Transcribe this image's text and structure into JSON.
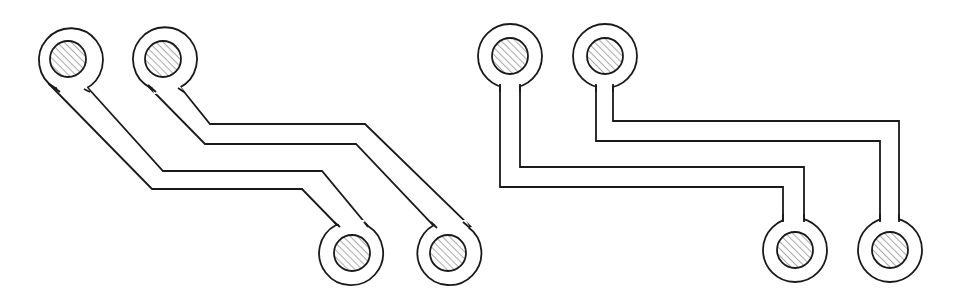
{
  "diagram": {
    "colors": {
      "line": "#1a1a1a",
      "background": "#ffffff",
      "hatch": "#555555"
    },
    "figures": [
      {
        "id": "left-figure",
        "style": "diagonal (45-degree) traces",
        "pads": [
          {
            "id": "pad-top-left-1",
            "cx": 68,
            "cy": 59
          },
          {
            "id": "pad-top-left-2",
            "cx": 163,
            "cy": 59
          },
          {
            "id": "pad-bottom-left-1",
            "cx": 352,
            "cy": 253
          },
          {
            "id": "pad-bottom-left-2",
            "cx": 448,
            "cy": 253
          }
        ],
        "traces": [
          {
            "from": "pad-top-left-1",
            "to": "pad-bottom-left-1"
          },
          {
            "from": "pad-top-left-2",
            "to": "pad-bottom-left-2"
          }
        ]
      },
      {
        "id": "right-figure",
        "style": "orthogonal (90-degree) traces",
        "pads": [
          {
            "id": "pad-top-right-1",
            "cx": 510,
            "cy": 56
          },
          {
            "id": "pad-top-right-2",
            "cx": 605,
            "cy": 56
          },
          {
            "id": "pad-bottom-right-1",
            "cx": 795,
            "cy": 250
          },
          {
            "id": "pad-bottom-right-2",
            "cx": 890,
            "cy": 250
          }
        ],
        "traces": [
          {
            "from": "pad-top-right-1",
            "to": "pad-bottom-right-1"
          },
          {
            "from": "pad-top-right-2",
            "to": "pad-bottom-right-2"
          }
        ]
      }
    ],
    "pad_geometry": {
      "outer_radius": 32,
      "hole_radius": 18
    }
  }
}
